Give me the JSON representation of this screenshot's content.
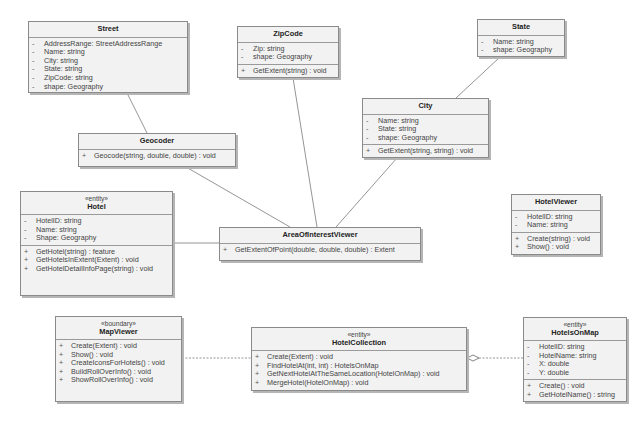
{
  "diagram": {
    "type": "UML class diagram",
    "classes": {
      "street": {
        "name": "Street",
        "attributes": [
          {
            "vis": "-",
            "text": "AddressRange:  StreetAddressRange"
          },
          {
            "vis": "-",
            "text": "Name:  string"
          },
          {
            "vis": "-",
            "text": "City:  string"
          },
          {
            "vis": "-",
            "text": "State:  string"
          },
          {
            "vis": "-",
            "text": "ZipCode:  string"
          },
          {
            "vis": "-",
            "text": "shape:  Geography"
          }
        ]
      },
      "zipcode": {
        "name": "ZipCode",
        "attributes": [
          {
            "vis": "-",
            "text": "Zip:  string"
          },
          {
            "vis": "-",
            "text": "shape:  Geography"
          }
        ],
        "operations": [
          {
            "vis": "+",
            "text": "GetExtent(string) : void"
          }
        ]
      },
      "state": {
        "name": "State",
        "attributes": [
          {
            "vis": "-",
            "text": "Name:  string"
          },
          {
            "vis": "-",
            "text": "shape:  Geography"
          }
        ]
      },
      "city": {
        "name": "City",
        "attributes": [
          {
            "vis": "-",
            "text": "Name:  string"
          },
          {
            "vis": "-",
            "text": "State:  string"
          },
          {
            "vis": "-",
            "text": "shape:  Geography"
          }
        ],
        "operations": [
          {
            "vis": "+",
            "text": "GetExtent(string, string) : void"
          }
        ]
      },
      "geocoder": {
        "name": "Geocoder",
        "operations": [
          {
            "vis": "+",
            "text": "Geocode(string, double, double) : void"
          }
        ]
      },
      "hotel": {
        "stereotype": "«entity»",
        "name": "Hotel",
        "attributes": [
          {
            "vis": "-",
            "text": "HotelID:  string"
          },
          {
            "vis": "-",
            "text": "Name:  string"
          },
          {
            "vis": "-",
            "text": "Shape:  Geography"
          }
        ],
        "operations": [
          {
            "vis": "+",
            "text": "GetHotel(string) : feature"
          },
          {
            "vis": "+",
            "text": "GetHotelsInExtent(Extent) : void"
          },
          {
            "vis": "+",
            "text": "GetHotelDetailInfoPage(string) : void"
          }
        ]
      },
      "aoiviewer": {
        "name": "AreaOfInterestViewer",
        "operations": [
          {
            "vis": "+",
            "text": "GetExtentOfPoint(double, double, double) : Extent"
          }
        ]
      },
      "hotelviewer": {
        "name": "HotelViewer",
        "attributes": [
          {
            "vis": "-",
            "text": "HotelID:  string"
          },
          {
            "vis": "-",
            "text": "Name:  string"
          }
        ],
        "operations": [
          {
            "vis": "+",
            "text": "Create(string) : void"
          },
          {
            "vis": "+",
            "text": "Show() : void"
          }
        ]
      },
      "mapviewer": {
        "stereotype": "«boundary»",
        "name": "MapViewer",
        "operations": [
          {
            "vis": "+",
            "text": "Create(Extent) : void"
          },
          {
            "vis": "+",
            "text": "Show() : void"
          },
          {
            "vis": "+",
            "text": "CreateIconsForHotels() : void"
          },
          {
            "vis": "+",
            "text": "BuildRollOverInfo() : void"
          },
          {
            "vis": "+",
            "text": "ShowRollOverInfo() : void"
          }
        ]
      },
      "hotelcollection": {
        "stereotype": "«entity»",
        "name": "HotelCollection",
        "operations": [
          {
            "vis": "+",
            "text": "Create(Extent) : void"
          },
          {
            "vis": "+",
            "text": "FindHotelAt(int, int) : HotelsOnMap"
          },
          {
            "vis": "+",
            "text": "GetNextHotelAtTheSameLocation(HotelOnMap) : void"
          },
          {
            "vis": "+",
            "text": "MergeHotel(HotelOnMap) : void"
          }
        ]
      },
      "hotelsonmap": {
        "stereotype": "«entity»",
        "name": "HotelsOnMap",
        "attributes": [
          {
            "vis": "-",
            "text": "HotelID:  string"
          },
          {
            "vis": "-",
            "text": "HotelName:  string"
          },
          {
            "vis": "-",
            "text": "X:  double"
          },
          {
            "vis": "-",
            "text": "Y:  double"
          }
        ],
        "operations": [
          {
            "vis": "+",
            "text": "Create() : void"
          },
          {
            "vis": "+",
            "text": "GetHotelName() : string"
          }
        ]
      }
    },
    "relationships": [
      {
        "from": "Street",
        "to": "Geocoder",
        "kind": "association"
      },
      {
        "from": "Geocoder",
        "to": "AreaOfInterestViewer",
        "kind": "association"
      },
      {
        "from": "ZipCode",
        "to": "AreaOfInterestViewer",
        "kind": "association"
      },
      {
        "from": "State",
        "to": "City",
        "kind": "association"
      },
      {
        "from": "City",
        "to": "AreaOfInterestViewer",
        "kind": "association"
      },
      {
        "from": "Hotel",
        "to": "AreaOfInterestViewer",
        "kind": "association"
      },
      {
        "from": "MapViewer",
        "to": "HotelCollection",
        "kind": "association (dashed)"
      },
      {
        "from": "HotelCollection",
        "to": "HotelsOnMap",
        "kind": "aggregation (hollow diamond at HotelCollection)"
      }
    ],
    "colors": {
      "box_fill": "#f2f2f2",
      "box_border": "#8a8a8a",
      "line": "#777777"
    }
  }
}
